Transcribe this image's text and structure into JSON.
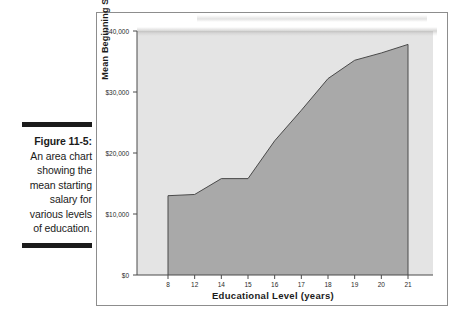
{
  "figure": {
    "label": "Figure 11-5:",
    "caption": "An area chart showing the mean starting salary for various levels of education."
  },
  "colors": {
    "area_fill": "#a9a9a9",
    "area_stroke": "#4a4a4a",
    "plot_background": "#e4e4e4",
    "frame_border": "#8d8d8d",
    "text": "#1b1b1b"
  },
  "chart_data": {
    "type": "area",
    "title": "",
    "subtitle": "",
    "xlabel": "Educational Level (years)",
    "ylabel": "Mean Beginning Salary",
    "categories": [
      "8",
      "12",
      "14",
      "15",
      "16",
      "17",
      "18",
      "19",
      "20",
      "21"
    ],
    "values": [
      13000,
      13200,
      15800,
      15800,
      22000,
      27000,
      32200,
      35200,
      36400,
      37800
    ],
    "series": [
      {
        "name": "Mean Beginning Salary",
        "values": [
          13000,
          13200,
          15800,
          15800,
          22000,
          27000,
          32200,
          35200,
          36400,
          37800
        ]
      }
    ],
    "ylim": [
      0,
      40000
    ],
    "y_ticks": [
      0,
      10000,
      20000,
      30000,
      40000
    ],
    "y_tick_labels": [
      "$0",
      "$10,000",
      "$20,000",
      "$30,000",
      "$40,000"
    ],
    "x_tick_labels": [
      "8",
      "12",
      "14",
      "15",
      "16",
      "17",
      "18",
      "19",
      "20",
      "21"
    ],
    "grid": false,
    "legend": "none"
  }
}
